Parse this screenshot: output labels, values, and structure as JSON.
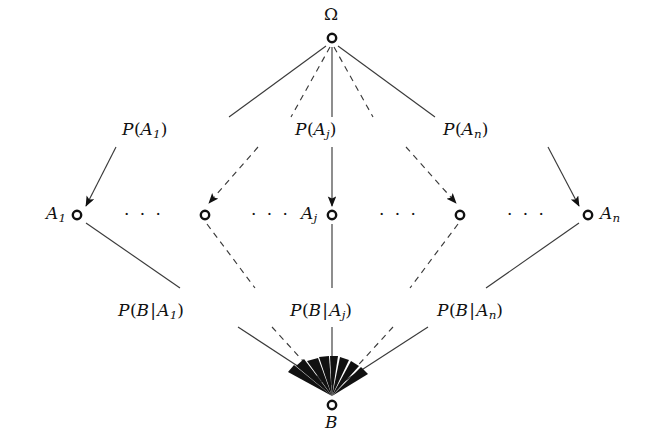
{
  "diagram": {
    "title_symbol": "Ω",
    "canvas": {
      "width": 646,
      "height": 446,
      "background": "#ffffff"
    },
    "stroke_color": "#3a3a3a",
    "text_color": "#111111",
    "nodes": [
      {
        "id": "omega",
        "label": "Ω",
        "x": 332,
        "y": 38,
        "label_pos": "above",
        "style": "open-circle"
      },
      {
        "id": "a1",
        "label": "A",
        "sub": "1",
        "x": 77,
        "y": 215,
        "label_pos": "left",
        "style": "open-circle"
      },
      {
        "id": "adots1",
        "label": "",
        "sub": "",
        "x": 205,
        "y": 215,
        "label_pos": "none",
        "style": "open-circle"
      },
      {
        "id": "aj",
        "label": "A",
        "sub": "j",
        "x": 332,
        "y": 215,
        "label_pos": "left",
        "style": "open-circle"
      },
      {
        "id": "adots2",
        "label": "",
        "sub": "",
        "x": 460,
        "y": 215,
        "label_pos": "none",
        "style": "open-circle"
      },
      {
        "id": "an",
        "label": "A",
        "sub": "n",
        "x": 588,
        "y": 215,
        "label_pos": "right",
        "style": "open-circle"
      },
      {
        "id": "b",
        "label": "B",
        "sub": "",
        "x": 332,
        "y": 405,
        "label_pos": "below",
        "style": "open-circle"
      }
    ],
    "ellipses": [
      {
        "id": "dots-left-1",
        "text": "· · ·",
        "x": 141,
        "y": 213
      },
      {
        "id": "dots-left-2",
        "text": "· · ·",
        "x": 268,
        "y": 213
      },
      {
        "id": "dots-right-1",
        "text": "· · ·",
        "x": 396,
        "y": 213
      },
      {
        "id": "dots-right-2",
        "text": "· · ·",
        "x": 524,
        "y": 213
      }
    ],
    "upper_edges": [
      {
        "id": "omega-to-a1",
        "from": "omega",
        "to": "a1",
        "style": "solid",
        "arrow": true
      },
      {
        "id": "omega-to-adots1",
        "from": "omega",
        "to": "adots1",
        "style": "dashed",
        "arrow": true
      },
      {
        "id": "omega-to-aj",
        "from": "omega",
        "to": "aj",
        "style": "solid",
        "arrow": true
      },
      {
        "id": "omega-to-adots2",
        "from": "omega",
        "to": "adots2",
        "style": "dashed",
        "arrow": true
      },
      {
        "id": "omega-to-an",
        "from": "omega",
        "to": "an",
        "style": "solid",
        "arrow": true
      }
    ],
    "lower_edges": [
      {
        "id": "a1-to-b",
        "from": "a1",
        "to": "b",
        "style": "solid",
        "arrow": true
      },
      {
        "id": "adots1-to-b",
        "from": "adots1",
        "to": "b",
        "style": "dashed",
        "arrow": true
      },
      {
        "id": "aj-to-b",
        "from": "aj",
        "to": "b",
        "style": "solid",
        "arrow": true
      },
      {
        "id": "adots2-to-b",
        "from": "adots2",
        "to": "b",
        "style": "dashed",
        "arrow": true
      },
      {
        "id": "an-to-b",
        "from": "an",
        "to": "b",
        "style": "solid",
        "arrow": true
      }
    ],
    "upper_labels": [
      {
        "id": "p-a1",
        "prefix": "P",
        "open": "(",
        "base": "A",
        "sub": "1",
        "close": ")",
        "x": 122,
        "y": 131
      },
      {
        "id": "p-aj",
        "prefix": "P",
        "open": "(",
        "base": "A",
        "sub": "j",
        "close": ")",
        "x": 295,
        "y": 131
      },
      {
        "id": "p-an",
        "prefix": "P",
        "open": "(",
        "base": "A",
        "sub": "n",
        "close": ")",
        "x": 443,
        "y": 131
      }
    ],
    "lower_labels": [
      {
        "id": "p-b-given-a1",
        "prefix": "P",
        "open": "(",
        "cond": "B",
        "bar": "|",
        "base": "A",
        "sub": "1",
        "close": ")",
        "x": 118,
        "y": 312
      },
      {
        "id": "p-b-given-aj",
        "prefix": "P",
        "open": "(",
        "cond": "B",
        "bar": "|",
        "base": "A",
        "sub": "j",
        "close": ")",
        "x": 290,
        "y": 312
      },
      {
        "id": "p-b-given-an",
        "prefix": "P",
        "open": "(",
        "cond": "B",
        "bar": "|",
        "base": "A",
        "sub": "n",
        "close": ")",
        "x": 437,
        "y": 312
      }
    ],
    "fan_arrow_count": 7
  }
}
